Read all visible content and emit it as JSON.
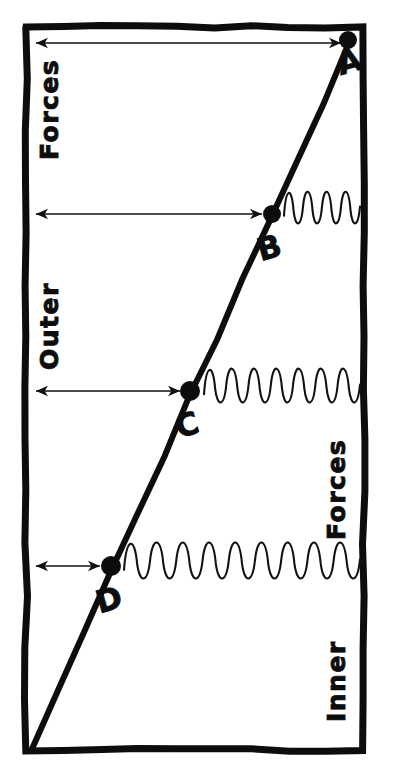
{
  "figure": {
    "background_color": "#ffffff",
    "ink_color": "#0d0d0d",
    "frame": {
      "x": 26,
      "y": 27,
      "width": 338,
      "height": 723,
      "stroke_width": 7
    }
  },
  "labels": {
    "outer_forces_top": "Forces",
    "outer_forces_bottom": "Outer",
    "inner_forces_top": "Forces",
    "inner_forces_bottom": "Inner"
  },
  "points": [
    {
      "id": "A",
      "label": "A",
      "x": 348,
      "y": 40,
      "label_x": 352,
      "label_y": 72,
      "dot_r": 9
    },
    {
      "id": "B",
      "label": "B",
      "x": 272,
      "y": 214,
      "label_x": 272,
      "label_y": 258,
      "dot_r": 9
    },
    {
      "id": "C",
      "label": "C",
      "x": 190,
      "y": 391,
      "label_x": 190,
      "label_y": 435,
      "dot_r": 10
    },
    {
      "id": "D",
      "label": "D",
      "x": 111,
      "y": 566,
      "label_x": 112,
      "label_y": 610,
      "dot_r": 10
    }
  ],
  "trend_line": {
    "description": "straight line from lower-left corner up to point A",
    "x1": 32,
    "y1": 749,
    "x2": 349,
    "y2": 44,
    "stroke_width": 6
  },
  "measure_arrows": [
    {
      "id": "arrow-A",
      "point": "A",
      "y": 43,
      "x_start": 36,
      "x_end": 341,
      "length": 305,
      "double_headed": true
    },
    {
      "id": "arrow-B",
      "point": "B",
      "y": 214,
      "x_start": 36,
      "x_end": 262,
      "length": 226,
      "double_headed": true
    },
    {
      "id": "arrow-C",
      "point": "C",
      "y": 391,
      "x_start": 36,
      "x_end": 180,
      "length": 144,
      "double_headed": true
    },
    {
      "id": "arrow-D",
      "point": "D",
      "y": 566,
      "x_start": 36,
      "x_end": 100,
      "length": 64,
      "double_headed": true
    }
  ],
  "springs": [
    {
      "id": "spring-B",
      "point": "B",
      "x_start": 284,
      "x_end": 360,
      "y": 208,
      "coils": 4,
      "amplitude": 14
    },
    {
      "id": "spring-C",
      "point": "C",
      "x_start": 204,
      "x_end": 360,
      "y": 386,
      "coils": 7,
      "amplitude": 15
    },
    {
      "id": "spring-D",
      "point": "D",
      "x_start": 124,
      "x_end": 360,
      "y": 561,
      "coils": 9,
      "amplitude": 16
    }
  ],
  "chart_data": {
    "type": "line",
    "xlabel": "Outer Forces",
    "ylabel": "Inner Forces",
    "grid": false,
    "legend": "none",
    "annotations": [
      "A",
      "B",
      "C",
      "D"
    ],
    "series": [
      {
        "name": "equilibrium line",
        "points": [
          {
            "label": "D",
            "outer_force": 64,
            "inner_force": 184
          },
          {
            "label": "C",
            "outer_force": 144,
            "inner_force": 359
          },
          {
            "label": "B",
            "outer_force": 226,
            "inner_force": 536
          },
          {
            "label": "A",
            "outer_force": 305,
            "inner_force": 710
          }
        ]
      }
    ],
    "xlim": [
      0,
      338
    ],
    "ylim": [
      0,
      723
    ]
  }
}
